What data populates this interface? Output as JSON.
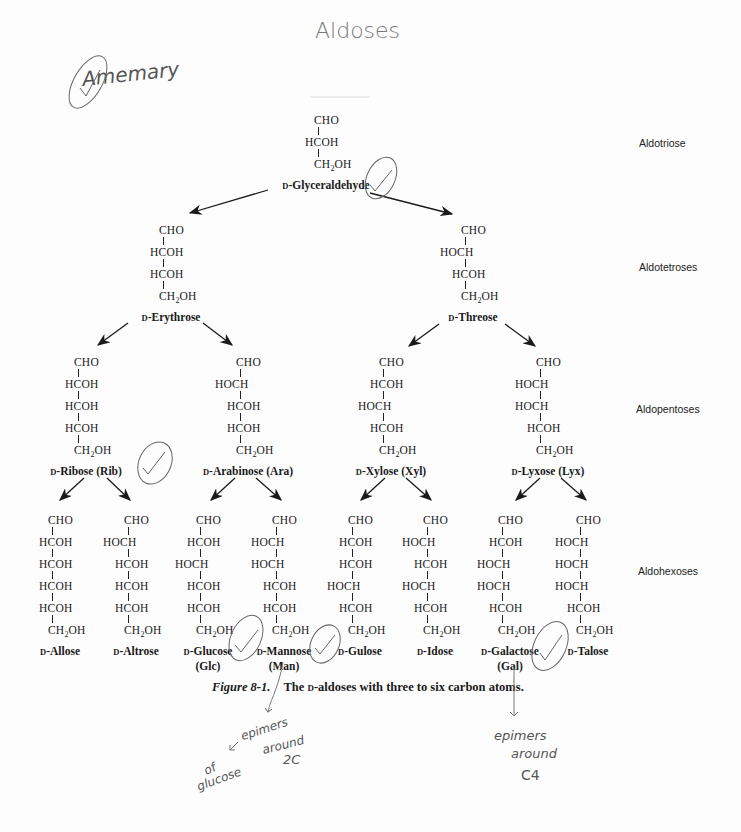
{
  "handwritten": {
    "title": "Aldoses",
    "signature": "Amemary",
    "note_left_1": "epimers",
    "note_left_2": "around",
    "note_left_3": "2C",
    "note_left_4": "of",
    "note_left_5": "glucose",
    "note_right_1": "epimers",
    "note_right_2": "around",
    "note_right_3": "C4"
  },
  "levels": {
    "triose": "Aldotriose",
    "tetrose": "Aldotetroses",
    "pentose": "Aldopentoses",
    "hexose": "Aldohexoses"
  },
  "caption": {
    "label": "Figure 8-1.",
    "text_pre": "The ",
    "text_d": "D",
    "text_post": "-aldoses with three to six carbon atoms."
  },
  "structures": {
    "glyceraldehyde": {
      "rows": [
        "CHO",
        "HCOH",
        "CH2OH"
      ],
      "prefix": "D",
      "name": "-Glyceraldehyde"
    },
    "erythrose": {
      "rows": [
        "CHO",
        "HCOH",
        "HCOH",
        "CH2OH"
      ],
      "prefix": "D",
      "name": "-Erythrose"
    },
    "threose": {
      "rows": [
        "CHO",
        "HOCH",
        "HCOH",
        "CH2OH"
      ],
      "prefix": "D",
      "name": "-Threose"
    },
    "ribose": {
      "rows": [
        "CHO",
        "HCOH",
        "HCOH",
        "HCOH",
        "CH2OH"
      ],
      "prefix": "D",
      "name": "-Ribose (Rib)"
    },
    "arabinose": {
      "rows": [
        "CHO",
        "HOCH",
        "HCOH",
        "HCOH",
        "CH2OH"
      ],
      "prefix": "D",
      "name": "-Arabinose (Ara)"
    },
    "xylose": {
      "rows": [
        "CHO",
        "HCOH",
        "HOCH",
        "HCOH",
        "CH2OH"
      ],
      "prefix": "D",
      "name": "-Xylose (Xyl)"
    },
    "lyxose": {
      "rows": [
        "CHO",
        "HOCH",
        "HOCH",
        "HCOH",
        "CH2OH"
      ],
      "prefix": "D",
      "name": "-Lyxose (Lyx)"
    },
    "allose": {
      "rows": [
        "CHO",
        "HCOH",
        "HCOH",
        "HCOH",
        "HCOH",
        "CH2OH"
      ],
      "prefix": "D",
      "name": "-Allose"
    },
    "altrose": {
      "rows": [
        "CHO",
        "HOCH",
        "HCOH",
        "HCOH",
        "HCOH",
        "CH2OH"
      ],
      "prefix": "D",
      "name": "-Altrose"
    },
    "glucose": {
      "rows": [
        "CHO",
        "HCOH",
        "HOCH",
        "HCOH",
        "HCOH",
        "CH2OH"
      ],
      "prefix": "D",
      "name": "-Glucose",
      "abbr": "(Glc)"
    },
    "mannose": {
      "rows": [
        "CHO",
        "HOCH",
        "HOCH",
        "HCOH",
        "HCOH",
        "CH2OH"
      ],
      "prefix": "D",
      "name": "-Mannose",
      "abbr": "(Man)"
    },
    "gulose": {
      "rows": [
        "CHO",
        "HCOH",
        "HCOH",
        "HOCH",
        "HCOH",
        "CH2OH"
      ],
      "prefix": "D",
      "name": "-Gulose"
    },
    "idose": {
      "rows": [
        "CHO",
        "HOCH",
        "HCOH",
        "HOCH",
        "HCOH",
        "CH2OH"
      ],
      "prefix": "D",
      "name": "-Idose"
    },
    "galactose": {
      "rows": [
        "CHO",
        "HCOH",
        "HOCH",
        "HOCH",
        "HCOH",
        "CH2OH"
      ],
      "prefix": "D",
      "name": "-Galactose",
      "abbr": "(Gal)"
    },
    "talose": {
      "rows": [
        "CHO",
        "HOCH",
        "HOCH",
        "HOCH",
        "HCOH",
        "CH2OH"
      ],
      "prefix": "D",
      "name": "-Talose"
    }
  },
  "colors": {
    "ink": "#1a1a1a",
    "pencil": "#555555",
    "paper": "#fdfdfd"
  }
}
